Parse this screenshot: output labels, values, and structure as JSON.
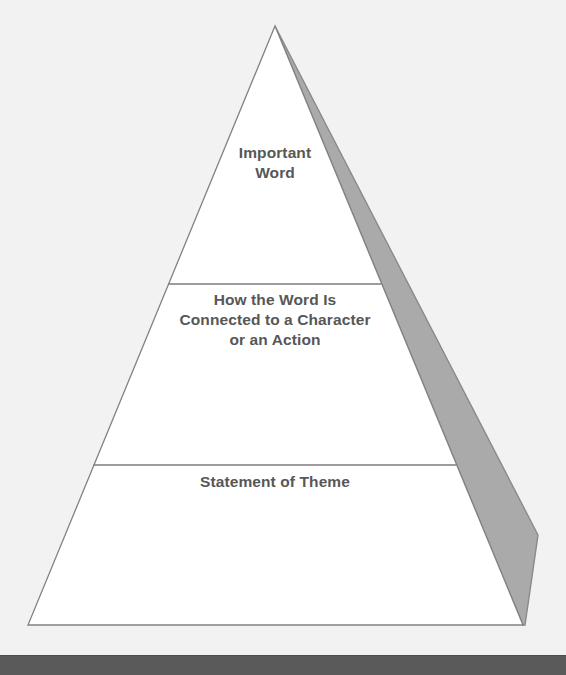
{
  "diagram": {
    "type": "pyramid",
    "name": "theme-pyramid",
    "orientation": "apex-up",
    "tier_count": 3,
    "tiers": [
      {
        "index": 1,
        "position": "top",
        "label": "Important\nWord"
      },
      {
        "index": 2,
        "position": "middle",
        "label": "How the Word Is\nConnected to a Character\nor an Action"
      },
      {
        "index": 3,
        "position": "bottom",
        "label": "Statement of Theme"
      }
    ]
  },
  "colors": {
    "background": "#f2f2f2",
    "pyramid_fill": "#ffffff",
    "pyramid_stroke": "#828282",
    "divider": "#7d7d7d",
    "shadow_fill": "#aaaaaa",
    "shadow_stroke": "#8a8a8a",
    "text": "#575757",
    "bottom_bar": "#5a5a5a"
  },
  "geometry": {
    "apex": [
      275,
      26
    ],
    "base_left": [
      28,
      625
    ],
    "base_right": [
      523,
      625
    ],
    "divider_1_y": 284,
    "divider_2_y": 465,
    "shadow_outer": [
      538,
      535
    ],
    "shadow_bottom": [
      525,
      625
    ]
  }
}
